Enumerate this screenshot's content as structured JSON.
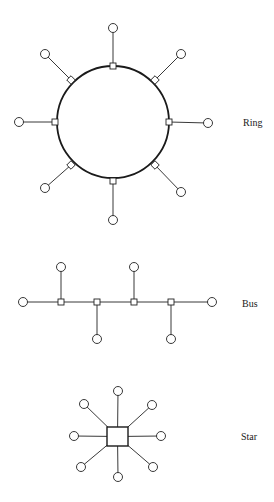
{
  "colors": {
    "line": "#222222",
    "background": "#ffffff",
    "text": "#1a1a1a"
  },
  "topologies": [
    {
      "id": "ring",
      "label": "Ring",
      "label_pos": [
        243,
        126
      ],
      "center": [
        113,
        122
      ],
      "radius": 56,
      "node_radius": 4.5,
      "tap_size": 6,
      "stations": [
        {
          "angle": -90,
          "tap": [
            113,
            66
          ],
          "node": [
            113,
            28
          ],
          "tap_shape": "square"
        },
        {
          "angle": -45,
          "tap": [
            155,
            80
          ],
          "node": [
            181,
            54
          ],
          "tap_shape": "diamond"
        },
        {
          "angle": 0,
          "tap": [
            169,
            122
          ],
          "node": [
            208,
            123
          ],
          "tap_shape": "square"
        },
        {
          "angle": 45,
          "tap": [
            155,
            165
          ],
          "node": [
            181,
            192
          ],
          "tap_shape": "diamond"
        },
        {
          "angle": 90,
          "tap": [
            113,
            181
          ],
          "node": [
            113,
            220
          ],
          "tap_shape": "square"
        },
        {
          "angle": 135,
          "tap": [
            71,
            165
          ],
          "node": [
            45,
            188
          ],
          "tap_shape": "diamond"
        },
        {
          "angle": 180,
          "tap": [
            55,
            122
          ],
          "node": [
            19,
            122
          ],
          "tap_shape": "square"
        },
        {
          "angle": -135,
          "tap": [
            71,
            80
          ],
          "node": [
            45,
            54
          ],
          "tap_shape": "diamond"
        }
      ]
    },
    {
      "id": "bus",
      "label": "Bus",
      "label_pos": [
        242,
        307
      ],
      "bus_y": 302,
      "ends": [
        [
          23,
          302
        ],
        [
          212,
          302
        ]
      ],
      "node_radius": 4.5,
      "tap_size": 6,
      "stations": [
        {
          "tap": [
            61,
            302
          ],
          "node": [
            61,
            267
          ],
          "direction": "up"
        },
        {
          "tap": [
            97,
            302
          ],
          "node": [
            97,
            339
          ],
          "direction": "down"
        },
        {
          "tap": [
            134,
            302
          ],
          "node": [
            134,
            267
          ],
          "direction": "up"
        },
        {
          "tap": [
            171,
            302
          ],
          "node": [
            171,
            339
          ],
          "direction": "down"
        }
      ]
    },
    {
      "id": "star",
      "label": "Star",
      "label_pos": [
        241,
        440
      ],
      "hub": {
        "x": 107,
        "y": 427,
        "width": 21,
        "height": 19
      },
      "hub_center": [
        117.5,
        436.5
      ],
      "node_radius": 4.5,
      "stations": [
        {
          "position": "top",
          "node": [
            118,
            391
          ]
        },
        {
          "position": "top-right",
          "node": [
            152,
            405
          ]
        },
        {
          "position": "right",
          "node": [
            161,
            436
          ]
        },
        {
          "position": "bottom-right",
          "node": [
            153,
            467
          ]
        },
        {
          "position": "bottom",
          "node": [
            118,
            477
          ]
        },
        {
          "position": "bottom-left",
          "node": [
            81,
            467
          ]
        },
        {
          "position": "left",
          "node": [
            74,
            436
          ]
        },
        {
          "position": "top-left",
          "node": [
            84,
            404
          ]
        }
      ]
    }
  ]
}
